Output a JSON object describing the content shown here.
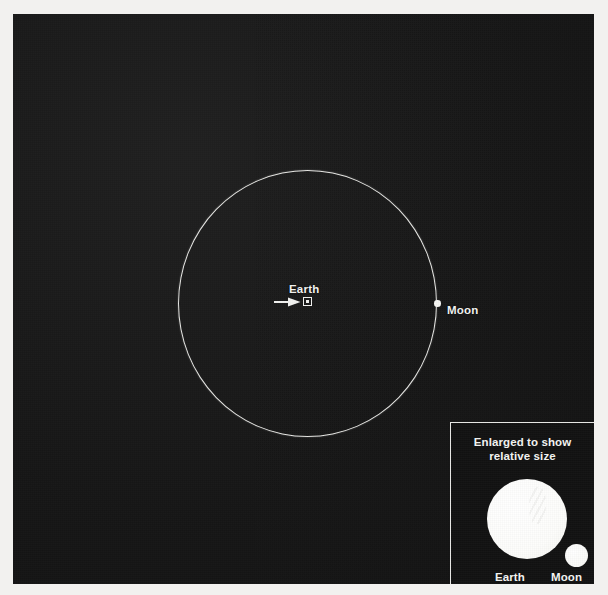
{
  "diagram": {
    "background_color": "#161616",
    "stroke_color": "#ebebe8",
    "body_color": "#ffffff",
    "page_color": "#f2f1ef"
  },
  "main_view": {
    "orbit": {
      "label": "moon-orbit-path",
      "center_x": 307,
      "center_y": 303,
      "radius": 131
    },
    "earth": {
      "label": "Earth",
      "marker": "square-with-center-dot",
      "pointer": "arrow-right",
      "x": 307,
      "y": 301
    },
    "moon": {
      "label": "Moon",
      "marker": "filled-dot",
      "x": 437,
      "y": 303
    }
  },
  "inset": {
    "title_line1": "Enlarged to show",
    "title_line2": "relative size",
    "earth_label": "Earth",
    "moon_label": "Moon",
    "earth_diameter_px": 80,
    "moon_diameter_px": 23
  }
}
